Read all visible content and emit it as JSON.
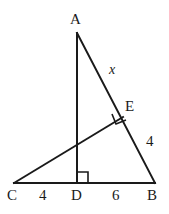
{
  "figure": {
    "type": "geometry-diagram",
    "background_color": "#ffffff",
    "stroke_color": "#1a1a1a",
    "vertices": {
      "A": {
        "label": "A",
        "x": 77,
        "y": 33
      },
      "B": {
        "label": "B",
        "x": 155,
        "y": 183
      },
      "C": {
        "label": "C",
        "x": 14,
        "y": 183
      },
      "D": {
        "label": "D",
        "x": 77,
        "y": 183
      },
      "E": {
        "label": "E",
        "x": 122,
        "y": 118
      }
    },
    "segments": [
      {
        "name": "AB",
        "from": "A",
        "to": "B"
      },
      {
        "name": "CB",
        "from": "C",
        "to": "B"
      },
      {
        "name": "AD",
        "from": "A",
        "to": "D"
      },
      {
        "name": "CE",
        "from": "C",
        "to": "E"
      }
    ],
    "right_angles": [
      {
        "name": "angle-at-D",
        "vertex": "D"
      },
      {
        "name": "angle-at-E",
        "vertex": "E"
      }
    ],
    "labels": {
      "vertex_a": "A",
      "vertex_b": "B",
      "vertex_c": "C",
      "vertex_d": "D",
      "point_e": "E",
      "segment_ae": "x",
      "segment_eb": "4",
      "segment_cd": "4",
      "segment_db": "6"
    }
  }
}
